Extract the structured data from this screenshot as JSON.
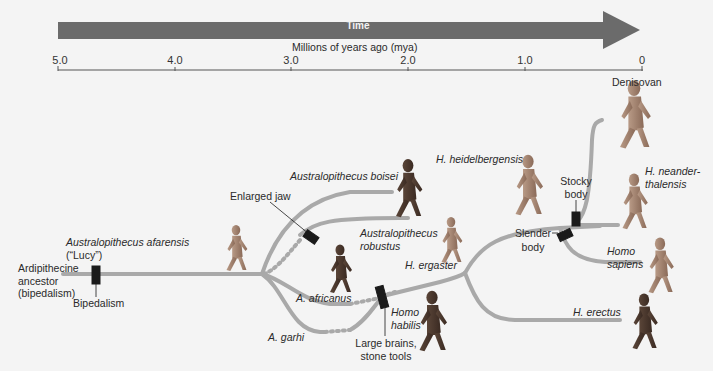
{
  "timeline": {
    "arrow_label": "Time",
    "axis_title": "Millions of years ago (mya)",
    "ticks": [
      {
        "label": "5.0",
        "x": 60
      },
      {
        "label": "4.0",
        "x": 175
      },
      {
        "label": "3.0",
        "x": 291
      },
      {
        "label": "2.0",
        "x": 408
      },
      {
        "label": "1.0",
        "x": 525
      },
      {
        "label": "0",
        "x": 642
      }
    ],
    "arrow_color": "#6b6b6b"
  },
  "colors": {
    "background": "#f4f4f4",
    "branch": "#a9a9a9",
    "marker": "#1a1a1a",
    "text": "#2a2a2a"
  },
  "species": {
    "ardipithecine": "Ardipithecine\nancestor\n(bipedalism)",
    "afarensis": "Australopithecus afarensis",
    "afarensis_nick": "(“Lucy”)",
    "boisei": "Australopithecus boisei",
    "robustus_1": "Australopithecus",
    "robustus_2": "robustus",
    "africanus": "A. africanus",
    "garhi": "A. garhi",
    "habilis_1": "Homo",
    "habilis_2": "habilis",
    "ergaster": "H. ergaster",
    "heidelbergensis": "H. heidelbergensis",
    "denisovan": "Denisovan",
    "neander_1": "H. neander-",
    "neander_2": "thalensis",
    "sapiens_1": "Homo",
    "sapiens_2": "sapiens",
    "erectus": "H. erectus"
  },
  "traits": {
    "bipedalism": "Bipedalism",
    "enlarged_jaw": "Enlarged jaw",
    "large_brains_1": "Large brains,",
    "large_brains_2": "stone tools",
    "stocky_1": "Stocky",
    "stocky_2": "body",
    "slender_1": "Slender",
    "slender_2": "body"
  }
}
